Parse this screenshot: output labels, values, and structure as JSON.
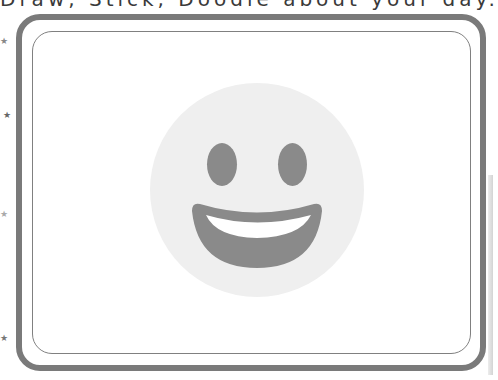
{
  "header": {
    "prompt_text": "Draw, Stick, Doodle about your day."
  },
  "decorations": {
    "stars": [
      {
        "icon": "star-icon",
        "glyph": "★",
        "x": 0,
        "y": 37,
        "color": "#888888"
      },
      {
        "icon": "star-icon",
        "glyph": "★",
        "x": 3,
        "y": 111,
        "color": "#666666"
      },
      {
        "icon": "star-icon",
        "glyph": "★",
        "x": 0,
        "y": 210,
        "color": "#aaaaaa"
      },
      {
        "icon": "star-icon",
        "glyph": "★",
        "x": 0,
        "y": 334,
        "color": "#777777"
      }
    ]
  },
  "canvas": {
    "outer_border_color": "#7a7a7a",
    "inner_border_color": "#808080",
    "icon": "grinning-face-icon",
    "face_color": "#efefef",
    "feature_color": "#8a8a8a",
    "teeth_color": "#ffffff"
  }
}
